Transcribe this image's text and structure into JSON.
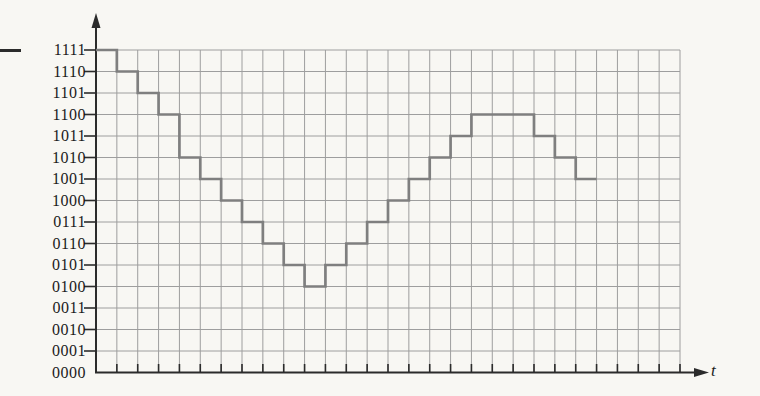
{
  "window": {
    "width": 760,
    "height": 396
  },
  "colors": {
    "paper": "#f8f7f3",
    "grid_line": "#9e9e9e",
    "waveform": "#7f7f7f",
    "axis": "#2b2b2b",
    "label_text": "#1b1b1b"
  },
  "decorations": {
    "left_edge_dash": true
  },
  "axis_labels": {
    "x": "t"
  },
  "chart_data": {
    "type": "line",
    "subtype": "staircase-steps",
    "title": "",
    "xlabel": "t",
    "ylabel": "",
    "y_tick_labels_top_to_bottom": [
      "1111",
      "1110",
      "1101",
      "1100",
      "1011",
      "1010",
      "1001",
      "1000",
      "0111",
      "0110",
      "0101",
      "0100",
      "0011",
      "0010",
      "0001",
      "0000"
    ],
    "ylim_decimal": [
      0,
      15
    ],
    "steps_binary": [
      "1111",
      "1110",
      "1101",
      "1100",
      "1010",
      "1001",
      "1000",
      "0111",
      "0110",
      "0101",
      "0100",
      "0101",
      "0110",
      "0111",
      "1000",
      "1001",
      "1010",
      "1011",
      "1100",
      "1100",
      "1100",
      "1011",
      "1010",
      "1001"
    ],
    "steps_decimal": [
      15,
      14,
      13,
      12,
      10,
      9,
      8,
      7,
      6,
      5,
      4,
      5,
      6,
      7,
      8,
      9,
      10,
      11,
      12,
      12,
      12,
      11,
      10,
      9
    ],
    "step_duration_columns": 1,
    "grid": {
      "visible": true,
      "columns": 28,
      "rows": 15
    },
    "legend": {
      "visible": false
    }
  }
}
